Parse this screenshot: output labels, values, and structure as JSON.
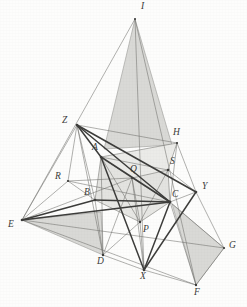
{
  "figure": {
    "width": 247,
    "height": 307,
    "background_color": "#fdfdfc",
    "line_color": "#555553",
    "thick_line_color": "#3d3d3b",
    "shade_fill": "#d9d9d6",
    "shade_stroke": "#9a9a97",
    "label_color": "#3a3a38",
    "label_style": "italic-serif"
  },
  "points": {
    "I": {
      "label": "I",
      "x": 135,
      "y": 19,
      "lx": 141,
      "ly": 2
    },
    "Z": {
      "label": "Z",
      "x": 77,
      "y": 125,
      "lx": 62,
      "ly": 116
    },
    "A": {
      "label": "A",
      "x": 101,
      "y": 157,
      "lx": 92,
      "ly": 143
    },
    "H": {
      "label": "H",
      "x": 177,
      "y": 143,
      "lx": 173,
      "ly": 128
    },
    "S": {
      "label": "S",
      "x": 168,
      "y": 170,
      "lx": 170,
      "ly": 157
    },
    "R": {
      "label": "R",
      "x": 68,
      "y": 181,
      "lx": 55,
      "ly": 172
    },
    "Q": {
      "label": "Q",
      "x": 132,
      "y": 178,
      "lx": 130,
      "ly": 165
    },
    "Y": {
      "label": "Y",
      "x": 196,
      "y": 192,
      "lx": 202,
      "ly": 182
    },
    "B": {
      "label": "B",
      "x": 95,
      "y": 200,
      "lx": 84,
      "ly": 188
    },
    "C": {
      "label": "C",
      "x": 170,
      "y": 202,
      "lx": 172,
      "ly": 190
    },
    "E": {
      "label": "E",
      "x": 22,
      "y": 220,
      "lx": 8,
      "ly": 220
    },
    "P": {
      "label": "P",
      "x": 140,
      "y": 222,
      "lx": 143,
      "ly": 225
    },
    "G": {
      "label": "G",
      "x": 224,
      "y": 248,
      "lx": 229,
      "ly": 241
    },
    "D": {
      "label": "D",
      "x": 103,
      "y": 255,
      "lx": 97,
      "ly": 257
    },
    "X": {
      "label": "X",
      "x": 144,
      "y": 270,
      "lx": 140,
      "ly": 272
    },
    "F": {
      "label": "F",
      "x": 196,
      "y": 285,
      "lx": 194,
      "ly": 288
    }
  },
  "shaded_regions": [
    {
      "name": "region-I-top-spire",
      "vertices": [
        "I",
        "left-base-148",
        "H"
      ],
      "fill": "#d9d9d6"
    },
    {
      "name": "region-E-left-wedge",
      "vertices": [
        "E",
        "apex-left",
        "D"
      ],
      "fill": "#d9d9d6"
    },
    {
      "name": "region-C-right-wedge",
      "vertices": [
        "C",
        "G",
        "F"
      ],
      "fill": "#d9d9d6"
    },
    {
      "name": "region-inner-band",
      "vertices": [
        "A",
        "B",
        "C",
        "S"
      ],
      "fill": "#e2e2df"
    }
  ],
  "thin_segments": [
    [
      "E",
      "I"
    ],
    [
      "I",
      "F"
    ],
    [
      "E",
      "F"
    ],
    [
      "E",
      "G"
    ],
    [
      "Z",
      "E"
    ],
    [
      "Z",
      "R"
    ],
    [
      "R",
      "E"
    ],
    [
      "R",
      "B"
    ],
    [
      "R",
      "C"
    ],
    [
      "Z",
      "H"
    ],
    [
      "H",
      "Y"
    ],
    [
      "Y",
      "G"
    ],
    [
      "G",
      "F"
    ],
    [
      "A",
      "H"
    ],
    [
      "A",
      "Q"
    ],
    [
      "Q",
      "S"
    ],
    [
      "Q",
      "C"
    ],
    [
      "B",
      "C"
    ],
    [
      "A",
      "B"
    ],
    [
      "D",
      "A"
    ],
    [
      "S",
      "C"
    ],
    [
      "P",
      "Q"
    ],
    [
      "P",
      "B"
    ],
    [
      "P",
      "C"
    ],
    [
      "P",
      "D"
    ],
    [
      "E",
      "C"
    ],
    [
      "E",
      "B"
    ],
    [
      "Z",
      "D"
    ],
    [
      "H",
      "S"
    ],
    [
      "S",
      "Y"
    ],
    [
      "D",
      "X"
    ],
    [
      "X",
      "F"
    ],
    [
      "X",
      "C"
    ],
    [
      "Z",
      "A"
    ],
    [
      "I",
      "X"
    ],
    [
      "Q",
      "X"
    ]
  ],
  "thick_segments": [
    [
      "Z",
      "A"
    ],
    [
      "Z",
      "C"
    ],
    [
      "Z",
      "Y"
    ],
    [
      "A",
      "X"
    ],
    [
      "X",
      "Y"
    ],
    [
      "B",
      "C"
    ],
    [
      "E",
      "C"
    ],
    [
      "E",
      "B"
    ],
    [
      "A",
      "C"
    ]
  ],
  "caption": ""
}
